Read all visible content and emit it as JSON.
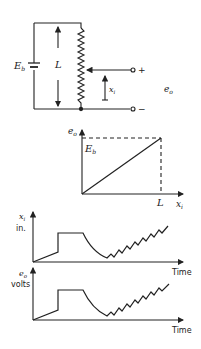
{
  "circuit": {
    "battery_label": "E",
    "battery_sub": "b",
    "length_label": "L",
    "wiper_label": "x",
    "wiper_sub": "i",
    "output_label": "e",
    "output_sub": "o",
    "plus": "+",
    "minus": "−"
  },
  "transfer_graph": {
    "y_label": "e",
    "y_sub": "o",
    "max_label": "E",
    "max_sub": "b",
    "x_label": "x",
    "x_sub": "i",
    "x_max_label": "L"
  },
  "input_graph": {
    "y_label_1": "x",
    "y_sub": "i",
    "y_label_2": "in.",
    "x_label": "Time"
  },
  "output_graph": {
    "y_label_1": "e",
    "y_sub": "o",
    "y_label_2": "volts",
    "x_label": "Time"
  },
  "colors": {
    "ink": "#222222",
    "background": "#ffffff"
  }
}
